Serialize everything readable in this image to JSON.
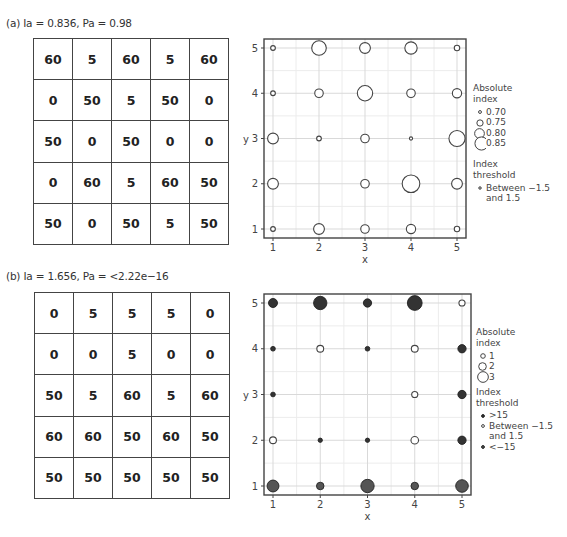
{
  "panels": [
    {
      "id": "a",
      "title": "(a) Ia = 0.836, Pa = 0.98",
      "grid": [
        [
          "60",
          "5",
          "60",
          "5",
          "60"
        ],
        [
          "0",
          "50",
          "5",
          "50",
          "0"
        ],
        [
          "50",
          "0",
          "50",
          "0",
          "0"
        ],
        [
          "0",
          "60",
          "5",
          "60",
          "50"
        ],
        [
          "50",
          "0",
          "50",
          "5",
          "50"
        ]
      ],
      "legend": {
        "size_title_1": "Absolute",
        "size_title_2": "index",
        "size_items": [
          "0.70",
          "0.75",
          "0.80",
          "0.85"
        ],
        "threshold_title_1": "Index",
        "threshold_title_2": "threshold",
        "threshold_items": [
          {
            "label_1": "Between −1.5",
            "label_2": "and 1.5"
          }
        ]
      }
    },
    {
      "id": "b",
      "title": "(b) Ia = 1.656, Pa = <2.22e−16",
      "grid": [
        [
          "0",
          "5",
          "5",
          "5",
          "0"
        ],
        [
          "0",
          "0",
          "5",
          "0",
          "0"
        ],
        [
          "50",
          "5",
          "60",
          "5",
          "60"
        ],
        [
          "60",
          "60",
          "50",
          "60",
          "50"
        ],
        [
          "50",
          "50",
          "50",
          "50",
          "50"
        ]
      ],
      "legend": {
        "size_title_1": "Absolute",
        "size_title_2": "index",
        "size_items": [
          "1",
          "2",
          "3"
        ],
        "threshold_title_1": "Index",
        "threshold_title_2": "threshold",
        "threshold_items": [
          {
            "label_1": ">15",
            "label_2": ""
          },
          {
            "label_1": "Between −1.5",
            "label_2": "and 1.5"
          },
          {
            "label_1": "<−15",
            "label_2": ""
          }
        ]
      }
    }
  ],
  "chart_data": [
    {
      "type": "scatter",
      "title": "(a) Ia = 0.836, Pa = 0.98",
      "xlabel": "x",
      "ylabel": "y",
      "xlim": [
        1,
        5
      ],
      "ylim": [
        1,
        5
      ],
      "x_ticks": [
        "1",
        "2",
        "3",
        "4",
        "5"
      ],
      "y_ticks": [
        "1",
        "2",
        "3",
        "4",
        "5"
      ],
      "grid": true,
      "legend_position": "right",
      "size_legend_title": "Absolute index",
      "size_legend": [
        0.7,
        0.75,
        0.8,
        0.85
      ],
      "color_legend_title": "Index threshold",
      "color_legend": [
        "Between −1.5 and 1.5"
      ],
      "points": [
        {
          "x": 1,
          "y": 5,
          "abs_index": 0.72,
          "threshold": "between"
        },
        {
          "x": 2,
          "y": 5,
          "abs_index": 0.85,
          "threshold": "between"
        },
        {
          "x": 3,
          "y": 5,
          "abs_index": 0.8,
          "threshold": "between"
        },
        {
          "x": 4,
          "y": 5,
          "abs_index": 0.82,
          "threshold": "between"
        },
        {
          "x": 5,
          "y": 5,
          "abs_index": 0.73,
          "threshold": "between"
        },
        {
          "x": 1,
          "y": 4,
          "abs_index": 0.72,
          "threshold": "between"
        },
        {
          "x": 2,
          "y": 4,
          "abs_index": 0.77,
          "threshold": "between"
        },
        {
          "x": 3,
          "y": 4,
          "abs_index": 0.86,
          "threshold": "between"
        },
        {
          "x": 4,
          "y": 4,
          "abs_index": 0.77,
          "threshold": "between"
        },
        {
          "x": 5,
          "y": 4,
          "abs_index": 0.78,
          "threshold": "between"
        },
        {
          "x": 1,
          "y": 3,
          "abs_index": 0.8,
          "threshold": "between"
        },
        {
          "x": 2,
          "y": 3,
          "abs_index": 0.72,
          "threshold": "between"
        },
        {
          "x": 3,
          "y": 3,
          "abs_index": 0.77,
          "threshold": "between"
        },
        {
          "x": 4,
          "y": 3,
          "abs_index": 0.7,
          "threshold": "between"
        },
        {
          "x": 5,
          "y": 3,
          "abs_index": 0.87,
          "threshold": "between"
        },
        {
          "x": 1,
          "y": 2,
          "abs_index": 0.8,
          "threshold": "between"
        },
        {
          "x": 3,
          "y": 2,
          "abs_index": 0.77,
          "threshold": "between"
        },
        {
          "x": 4,
          "y": 2,
          "abs_index": 0.89,
          "threshold": "between"
        },
        {
          "x": 5,
          "y": 2,
          "abs_index": 0.8,
          "threshold": "between"
        },
        {
          "x": 1,
          "y": 1,
          "abs_index": 0.72,
          "threshold": "between"
        },
        {
          "x": 2,
          "y": 1,
          "abs_index": 0.8,
          "threshold": "between"
        },
        {
          "x": 3,
          "y": 1,
          "abs_index": 0.77,
          "threshold": "between"
        },
        {
          "x": 4,
          "y": 1,
          "abs_index": 0.78,
          "threshold": "between"
        },
        {
          "x": 5,
          "y": 1,
          "abs_index": 0.73,
          "threshold": "between"
        }
      ]
    },
    {
      "type": "scatter",
      "title": "(b) Ia = 1.656, Pa = <2.22e−16",
      "xlabel": "x",
      "ylabel": "y",
      "xlim": [
        1,
        5
      ],
      "ylim": [
        1,
        5
      ],
      "x_ticks": [
        "1",
        "2",
        "3",
        "4",
        "5"
      ],
      "y_ticks": [
        "1",
        "2",
        "3",
        "4",
        "5"
      ],
      "grid": true,
      "legend_position": "right",
      "size_legend_title": "Absolute index",
      "size_legend": [
        1,
        2,
        3
      ],
      "color_legend_title": "Index threshold",
      "color_legend": [
        ">15",
        "Between −1.5 and 1.5",
        "<−15"
      ],
      "points": [
        {
          "x": 1,
          "y": 5,
          "abs_index": 2.0,
          "threshold": "high"
        },
        {
          "x": 2,
          "y": 5,
          "abs_index": 3.2,
          "threshold": "high"
        },
        {
          "x": 3,
          "y": 5,
          "abs_index": 1.8,
          "threshold": "high"
        },
        {
          "x": 4,
          "y": 5,
          "abs_index": 3.6,
          "threshold": "high"
        },
        {
          "x": 5,
          "y": 5,
          "abs_index": 1.2,
          "threshold": "between"
        },
        {
          "x": 1,
          "y": 4,
          "abs_index": 0.8,
          "threshold": "high"
        },
        {
          "x": 2,
          "y": 4,
          "abs_index": 1.4,
          "threshold": "between"
        },
        {
          "x": 3,
          "y": 4,
          "abs_index": 0.8,
          "threshold": "high"
        },
        {
          "x": 4,
          "y": 4,
          "abs_index": 1.4,
          "threshold": "between"
        },
        {
          "x": 5,
          "y": 4,
          "abs_index": 1.8,
          "threshold": "high"
        },
        {
          "x": 1,
          "y": 3,
          "abs_index": 0.8,
          "threshold": "high"
        },
        {
          "x": 4,
          "y": 3,
          "abs_index": 1.2,
          "threshold": "between"
        },
        {
          "x": 5,
          "y": 3,
          "abs_index": 1.8,
          "threshold": "high"
        },
        {
          "x": 1,
          "y": 2,
          "abs_index": 1.4,
          "threshold": "between"
        },
        {
          "x": 2,
          "y": 2,
          "abs_index": 0.7,
          "threshold": "high"
        },
        {
          "x": 3,
          "y": 2,
          "abs_index": 0.7,
          "threshold": "high"
        },
        {
          "x": 4,
          "y": 2,
          "abs_index": 1.6,
          "threshold": "between"
        },
        {
          "x": 5,
          "y": 2,
          "abs_index": 1.8,
          "threshold": "high"
        },
        {
          "x": 1,
          "y": 1,
          "abs_index": 2.8,
          "threshold": "low"
        },
        {
          "x": 2,
          "y": 1,
          "abs_index": 1.6,
          "threshold": "low"
        },
        {
          "x": 3,
          "y": 1,
          "abs_index": 3.2,
          "threshold": "low"
        },
        {
          "x": 4,
          "y": 1,
          "abs_index": 1.6,
          "threshold": "low"
        },
        {
          "x": 5,
          "y": 1,
          "abs_index": 3.0,
          "threshold": "low"
        }
      ]
    }
  ],
  "colors": {
    "frame": "#444444",
    "gridline": "#d9d9d9",
    "point_stroke": "#333333",
    "point_fill_dark": "#555555",
    "point_fill_hollow": "#ffffff",
    "text": "#333333"
  }
}
